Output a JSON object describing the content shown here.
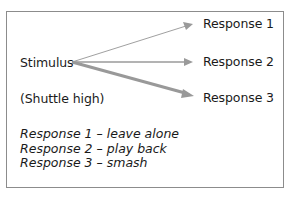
{
  "diagram": {
    "stimulus": "Stimulus",
    "condition": "(Shuttle high)",
    "responses": [
      "Response 1",
      "Response 2",
      "Response 3"
    ],
    "legend": [
      "Response 1 – leave alone",
      "Response 2 – play back",
      "Response 3 – smash"
    ],
    "colors": {
      "arrow": "#9a9a9a",
      "border": "#8c8c8c",
      "text": "#1a1a1a"
    }
  }
}
